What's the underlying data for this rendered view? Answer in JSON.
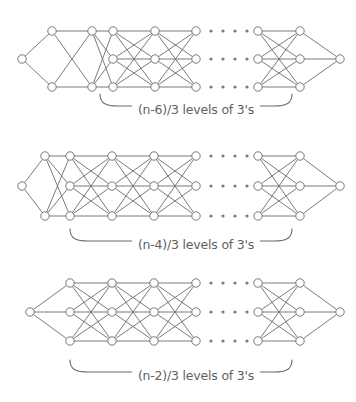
{
  "figure": {
    "background_color": "#ffffff",
    "stroke_color": "#6b6b6b",
    "node_fill": "#ffffff",
    "dot_color": "#7a7a7a",
    "caption_color": "#5f5f5f",
    "width": 356,
    "height": 402
  },
  "diagrams": [
    {
      "id": "diagram-1",
      "caption": "(n-6)/3 levels of 3's",
      "caption_x": 196,
      "caption_y": 110,
      "brace": {
        "x1": 100,
        "x2": 292,
        "y": 103,
        "depth": 9
      },
      "rows_y": [
        31,
        59,
        87
      ],
      "columns": [
        {
          "x": 22,
          "rows": [
            1
          ]
        },
        {
          "x": 52,
          "rows": [
            0,
            2
          ]
        },
        {
          "x": 92,
          "rows": [
            0,
            2
          ]
        },
        {
          "x": 113,
          "rows": [
            0,
            1,
            2
          ]
        },
        {
          "x": 155,
          "rows": [
            0,
            1,
            2
          ]
        },
        {
          "x": 196,
          "rows": [
            0,
            1,
            2
          ]
        },
        {
          "x": 258,
          "rows": [
            0,
            1,
            2
          ]
        },
        {
          "x": 300,
          "rows": [
            0,
            1,
            2
          ]
        },
        {
          "x": 340,
          "rows": [
            1
          ]
        }
      ],
      "ellipsis_x": [
        211,
        223,
        235,
        247
      ],
      "gap_after_column": 5
    },
    {
      "id": "diagram-2",
      "caption": "(n-4)/3 levels of 3's",
      "caption_x": 196,
      "caption_y": 245,
      "brace": {
        "x1": 70,
        "x2": 292,
        "y": 238,
        "depth": 9
      },
      "rows_y": [
        156,
        186,
        216
      ],
      "columns": [
        {
          "x": 22,
          "rows": [
            1
          ]
        },
        {
          "x": 45,
          "rows": [
            0,
            2
          ]
        },
        {
          "x": 70,
          "rows": [
            0,
            1,
            2
          ]
        },
        {
          "x": 112,
          "rows": [
            0,
            1,
            2
          ]
        },
        {
          "x": 154,
          "rows": [
            0,
            1,
            2
          ]
        },
        {
          "x": 196,
          "rows": [
            0,
            1,
            2
          ]
        },
        {
          "x": 258,
          "rows": [
            0,
            1,
            2
          ]
        },
        {
          "x": 300,
          "rows": [
            0,
            1,
            2
          ]
        },
        {
          "x": 340,
          "rows": [
            1
          ]
        }
      ],
      "ellipsis_x": [
        211,
        223,
        235,
        247
      ],
      "gap_after_column": 5
    },
    {
      "id": "diagram-3",
      "caption": "(n-2)/3 levels of 3's",
      "caption_x": 196,
      "caption_y": 376,
      "brace": {
        "x1": 70,
        "x2": 292,
        "y": 369,
        "depth": 9
      },
      "rows_y": [
        283,
        312,
        341
      ],
      "columns": [
        {
          "x": 30,
          "rows": [
            1
          ]
        },
        {
          "x": 70,
          "rows": [
            0,
            1,
            2
          ]
        },
        {
          "x": 112,
          "rows": [
            0,
            1,
            2
          ]
        },
        {
          "x": 154,
          "rows": [
            0,
            1,
            2
          ]
        },
        {
          "x": 196,
          "rows": [
            0,
            1,
            2
          ]
        },
        {
          "x": 258,
          "rows": [
            0,
            1,
            2
          ]
        },
        {
          "x": 300,
          "rows": [
            0,
            1,
            2
          ]
        },
        {
          "x": 340,
          "rows": [
            1
          ]
        }
      ],
      "ellipsis_x": [
        211,
        223,
        235,
        247
      ],
      "gap_after_column": 4
    }
  ],
  "node_radius": 4.2,
  "ellipsis_dot_radius": 1.6
}
